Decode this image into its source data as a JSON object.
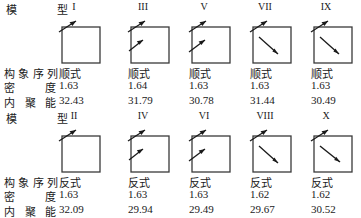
{
  "figure": {
    "header_label_chars": [
      "模",
      "型"
    ],
    "row_labels": [
      {
        "id": "conformation",
        "chars": [
          "构",
          "象",
          "序",
          "列"
        ],
        "text": "构象序列"
      },
      {
        "id": "density",
        "chars": [
          "密",
          "度"
        ],
        "text": "密 度"
      },
      {
        "id": "cohesive_energy",
        "chars": [
          "内",
          "聚",
          "能"
        ],
        "text": "内聚能"
      }
    ],
    "blocks": [
      {
        "id": "block-odd",
        "columns": [
          {
            "model": "I",
            "conformation": "顺式",
            "density": "32.43_placeholder",
            "density_value": "1.63",
            "cohesive_energy": "32.43",
            "arrows": [
              "corner"
            ]
          },
          {
            "model": "III",
            "conformation": "顺式",
            "density_value": "1.64",
            "cohesive_energy": "31.79",
            "arrows": [
              "corner",
              "left-inner"
            ]
          },
          {
            "model": "V",
            "conformation": "顺式",
            "density_value": "1.63",
            "cohesive_energy": "30.78",
            "arrows": [
              "corner",
              "left-inner"
            ]
          },
          {
            "model": "VII",
            "conformation": "顺式",
            "density_value": "1.63",
            "cohesive_energy": "31.44",
            "arrows": [
              "corner",
              "center-diagonal"
            ]
          },
          {
            "model": "IX",
            "conformation": "顺式",
            "density_value": "1.63",
            "cohesive_energy": "30.49",
            "arrows": [
              "corner",
              "center-diagonal"
            ]
          }
        ]
      },
      {
        "id": "block-even",
        "columns": [
          {
            "model": "II",
            "conformation": "反式",
            "density_value": "1.63",
            "cohesive_energy": "32.09",
            "arrows": [
              "corner"
            ]
          },
          {
            "model": "IV",
            "conformation": "反式",
            "density_value": "1.63",
            "cohesive_energy": "29.94",
            "arrows": [
              "corner",
              "left-inner"
            ]
          },
          {
            "model": "VI",
            "conformation": "反式",
            "density_value": "1.63",
            "cohesive_energy": "29.49",
            "arrows": [
              "corner",
              "left-inner"
            ]
          },
          {
            "model": "VIII",
            "conformation": "反式",
            "density_value": "1.62",
            "cohesive_energy": "29.67",
            "arrows": [
              "corner",
              "center-diagonal"
            ]
          },
          {
            "model": "X",
            "conformation": "反式",
            "density_value": "1.62",
            "cohesive_energy": "30.52",
            "arrows": [
              "corner",
              "center-diagonal"
            ]
          }
        ]
      }
    ],
    "colors": {
      "box_stroke": "#3a3a3a",
      "arrow_stroke": "#1a1a1a",
      "text": "#1a1a1a",
      "background": "#ffffff"
    }
  }
}
